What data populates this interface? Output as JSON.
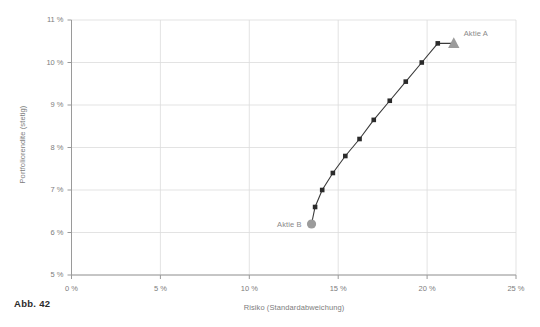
{
  "figure": {
    "caption": "Abb. 42",
    "background": "#ffffff"
  },
  "colors": {
    "grid": "#dcdcdc",
    "axis": "#9a9a9a",
    "line": "#3a3a3a",
    "marker": "#2b2b2b",
    "highlight_marker": "#9b9b9b",
    "tick_text": "#7d7d7d",
    "label_text": "#8a8a8a",
    "caption_text": "#2b2b2b"
  },
  "chart_data": {
    "type": "line",
    "title": "",
    "subtitle": "",
    "xlabel": "Risiko (Standardabweichung)",
    "ylabel": "Portfoliorendite (stetig)",
    "xlim": [
      0,
      25
    ],
    "ylim": [
      5,
      11
    ],
    "grid": true,
    "legend": "none",
    "x_tick_values": [
      0,
      5,
      10,
      15,
      20,
      25
    ],
    "x_tick_labels": [
      "0 %",
      "5 %",
      "10 %",
      "15 %",
      "20 %",
      "25 %"
    ],
    "y_tick_values": [
      5,
      6,
      7,
      8,
      9,
      10,
      11
    ],
    "y_tick_labels": [
      "5 %",
      "6 %",
      "7 %",
      "8 %",
      "9 %",
      "10 %",
      "11 %"
    ],
    "series": [
      {
        "name": "Effizienzlinie",
        "marker": "square",
        "x": [
          13.5,
          13.7,
          14.1,
          14.7,
          15.4,
          16.2,
          17.0,
          17.9,
          18.8,
          19.7,
          20.6,
          21.5
        ],
        "y": [
          6.2,
          6.6,
          7.0,
          7.4,
          7.8,
          8.2,
          8.65,
          9.1,
          9.55,
          10.0,
          10.45,
          10.45
        ]
      }
    ],
    "annotations": [
      {
        "name": "Aktie A",
        "label": "Aktie A",
        "x": 21.5,
        "y": 10.45,
        "marker": "triangle",
        "label_dx": 10,
        "label_dy": -10
      },
      {
        "name": "Aktie B",
        "label": "Aktie B",
        "x": 13.5,
        "y": 6.2,
        "marker": "circle",
        "label_dx": -10,
        "label_dy": 0
      }
    ]
  }
}
